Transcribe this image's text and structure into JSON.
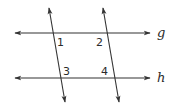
{
  "diagram": {
    "type": "parallel-lines-cut-by-transversals",
    "stroke_color": "#333333",
    "text_color": "#2b2b2b",
    "background": "#ffffff",
    "lines": [
      {
        "name": "g",
        "label": "g",
        "x1": 15,
        "y1": 33,
        "x2": 150,
        "y2": 33,
        "label_x": 157,
        "label_y": 37
      },
      {
        "name": "h",
        "label": "h",
        "x1": 15,
        "y1": 78,
        "x2": 150,
        "y2": 78,
        "label_x": 157,
        "label_y": 82
      }
    ],
    "transversals": [
      {
        "name": "left-transversal",
        "x1": 49,
        "y1": 8,
        "x2": 65,
        "y2": 102
      },
      {
        "name": "right-transversal",
        "x1": 103,
        "y1": 8,
        "x2": 119,
        "y2": 102
      }
    ],
    "angles": [
      {
        "label": "1",
        "x": 57,
        "y": 46
      },
      {
        "label": "2",
        "x": 96,
        "y": 46
      },
      {
        "label": "3",
        "x": 63,
        "y": 75
      },
      {
        "label": "4",
        "x": 101,
        "y": 75
      }
    ]
  }
}
